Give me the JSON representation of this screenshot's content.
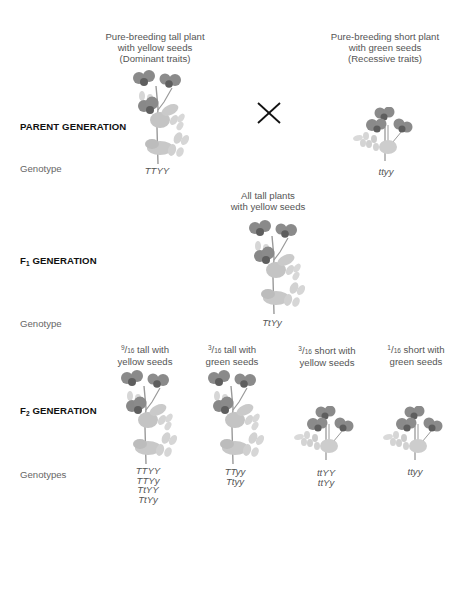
{
  "diagram": {
    "title_topic": "Mendelian dihybrid cross",
    "colors": {
      "text": "#555555",
      "label_bold": "#111111",
      "flower": "#8a8a8a",
      "flower_center": "#5e5e5e",
      "leaf": "#c4c4c4",
      "stem": "#9a9a9a",
      "cross": "#111111"
    },
    "parent_generation": {
      "label": "PARENT GENERATION",
      "genotype_label": "Genotype",
      "cross_symbol": "×",
      "parents": [
        {
          "caption_lines": [
            "Pure-breeding tall plant",
            "with yellow seeds",
            "(Dominant traits)"
          ],
          "plant": "tall-plant-icon",
          "genotype": "TTYY"
        },
        {
          "caption_lines": [
            "Pure-breeding short plant",
            "with green seeds",
            "(Recessive traits)"
          ],
          "plant": "short-plant-icon",
          "genotype": "ttyy"
        }
      ]
    },
    "f1_generation": {
      "label_prefix": "F",
      "label_sub": "1",
      "label_suffix": " GENERATION",
      "genotype_label": "Genotype",
      "caption_lines": [
        "All tall plants",
        "with yellow seeds"
      ],
      "plant": "tall-plant-icon",
      "genotype": "TtYy"
    },
    "f2_generation": {
      "label_prefix": "F",
      "label_sub": "2",
      "label_suffix": " GENERATION",
      "genotype_label": "Genotypes",
      "phenotypes": [
        {
          "fraction_num": "9",
          "fraction_den": "16",
          "caption_line1": " tall with",
          "caption_line2": "yellow seeds",
          "plant": "tall-plant-icon",
          "genotypes": [
            "TTYY",
            "TTYy",
            "TtYY",
            "TtYy"
          ]
        },
        {
          "fraction_num": "3",
          "fraction_den": "16",
          "caption_line1": " tall with",
          "caption_line2": "green seeds",
          "plant": "tall-plant-icon",
          "genotypes": [
            "TTyy",
            "Ttyy"
          ]
        },
        {
          "fraction_num": "3",
          "fraction_den": "16",
          "caption_line1": " short with",
          "caption_line2": "yellow seeds",
          "plant": "short-plant-icon",
          "genotypes": [
            "ttYY",
            "ttYy"
          ]
        },
        {
          "fraction_num": "1",
          "fraction_den": "16",
          "caption_line1": " short with",
          "caption_line2": "green seeds",
          "plant": "short-plant-icon",
          "genotypes": [
            "ttyy"
          ]
        }
      ]
    }
  }
}
